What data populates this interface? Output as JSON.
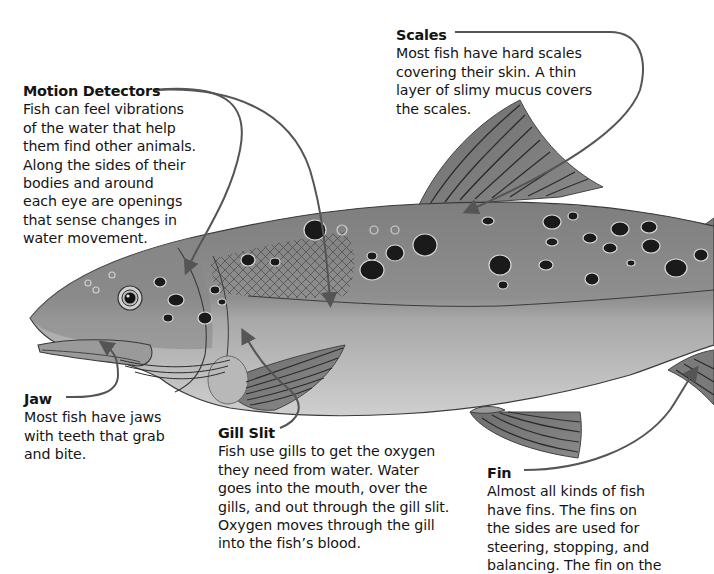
{
  "diagram": {
    "callouts": {
      "motion_detectors": {
        "title": "Motion Detectors",
        "body": "Fish can feel vibrations\nof the water that help\nthem find other animals.\nAlong the sides of their\nbodies and around\neach eye are openings\nthat sense changes in\nwater movement."
      },
      "scales": {
        "title": "Scales",
        "body": "Most fish have hard scales\ncovering their skin. A thin\nlayer of slimy mucus covers\nthe scales."
      },
      "jaw": {
        "title": "Jaw",
        "body": "Most fish have jaws\nwith teeth that grab\nand bite."
      },
      "gill_slit": {
        "title": "Gill Slit",
        "body": "Fish use gills to get the oxygen\nthey need from water. Water\ngoes into the mouth, over the\ngills, and out through the gill slit.\nOxygen moves through the gill\ninto the fish’s blood."
      },
      "fin": {
        "title": "Fin",
        "body": "Almost all kinds of fish\nhave fins. The fins on\nthe sides are used for\nsteering, stopping, and\nbalancing. The fin on the"
      }
    },
    "colors": {
      "background": "#ffffff",
      "body_upper": "#8a8a8a",
      "body_lower": "#c4c4c4",
      "fin": "#7a7a7a",
      "fin_ray": "#333333",
      "spot": "#1a1a1a",
      "spot_ring": "#d8d8d8",
      "leader_line": "#555555",
      "text": "#141414"
    }
  }
}
